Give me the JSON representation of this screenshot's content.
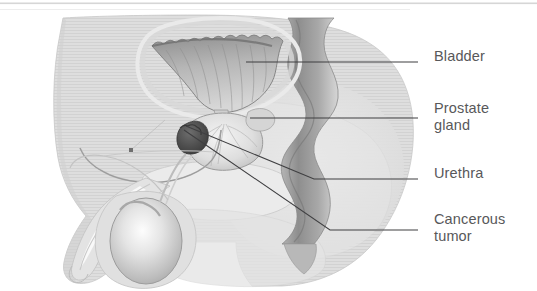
{
  "figure": {
    "kind": "medical-anatomy-diagram",
    "width": 537,
    "height": 291,
    "background_color": "#ffffff",
    "label_text_color": "#58585a",
    "leader_line_color": "#3f3f41",
    "body_fill_color": "#dcdcdc",
    "organ_fill_color": "#e8e8e8",
    "rectum_color": "#9a9a9a",
    "tumor_color": "#4a4a4a"
  },
  "labels": [
    {
      "id": "bladder",
      "text": "Bladder",
      "leader_y": 62
    },
    {
      "id": "prostate",
      "text": "Prostate\ngland",
      "leader_y": 118
    },
    {
      "id": "urethra",
      "text": "Urethra",
      "leader_y": 179
    },
    {
      "id": "tumor",
      "text": "Cancerous\ntumor",
      "leader_y": 230
    }
  ],
  "structures": [
    {
      "name": "body-silhouette",
      "description": "male lower torso, pelvis and thigh profile, light gray hatched fill"
    },
    {
      "name": "bladder",
      "description": "triangular lobed organ, upper center, gray shaded scalloped outline"
    },
    {
      "name": "prostate-gland",
      "description": "rounded gland below the bladder with radiating internal texture"
    },
    {
      "name": "cancerous-tumor",
      "description": "dark nodule on the lower-left margin of the prostate"
    },
    {
      "name": "urethra",
      "description": "thin tube running from the bladder neck through the prostate into the penis"
    },
    {
      "name": "rectum",
      "description": "dark wavy column posterior to the bladder and prostate"
    },
    {
      "name": "penis",
      "description": "shaft curving down and to the left from the pelvic floor"
    },
    {
      "name": "testicle",
      "description": "oval organ with bright central highlight inside the scrotum"
    },
    {
      "name": "pubic-bone",
      "description": "pale oval region anterior to the bladder"
    },
    {
      "name": "sacrum-region",
      "description": "large pale rounded region at the posterior of the pelvis"
    }
  ]
}
